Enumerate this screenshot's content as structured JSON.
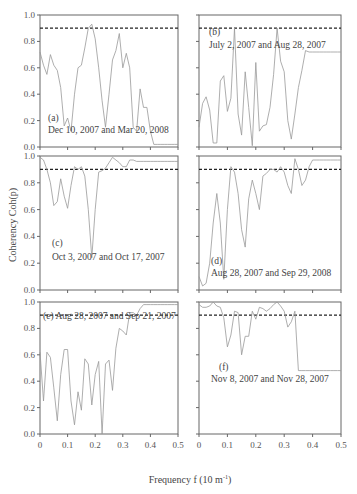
{
  "chart_data": {
    "type": "line",
    "layout": "3x2 grid of panels",
    "ylabel": "Coherency  Coh(p)",
    "xlabel_main": "Frequency f (10 m",
    "xlabel_sup": "-1",
    "xlabel_end": ")",
    "xlim": [
      0,
      0.5
    ],
    "ylim": [
      0,
      1.0
    ],
    "xticks": [
      "0",
      "0.1",
      "0.2",
      "0.3",
      "0.4",
      "0.5"
    ],
    "yticks": [
      "0.0",
      "0.2",
      "0.4",
      "0.6",
      "0.8",
      "1.0"
    ],
    "threshold": 0.9,
    "grid": false,
    "series_color": "#999999",
    "panels": [
      {
        "id": "a",
        "label": "(a)",
        "caption": "Dec 10, 2007 and Mar 20, 2008",
        "x": [
          0,
          0.0125,
          0.025,
          0.0375,
          0.05,
          0.0625,
          0.075,
          0.0875,
          0.1,
          0.1125,
          0.125,
          0.1375,
          0.15,
          0.1625,
          0.175,
          0.1875,
          0.2,
          0.2125,
          0.225,
          0.2375,
          0.25,
          0.2625,
          0.275,
          0.2875,
          0.3,
          0.3125,
          0.325,
          0.3375,
          0.35,
          0.3625,
          0.375,
          0.3875,
          0.4,
          0.4125,
          0.425,
          0.4375,
          0.45,
          0.4625,
          0.475,
          0.4875,
          0.5
        ],
        "y": [
          0.72,
          0.62,
          0.55,
          0.7,
          0.62,
          0.58,
          0.45,
          0.16,
          0.22,
          0.12,
          0.4,
          0.6,
          0.62,
          0.75,
          0.9,
          0.93,
          0.82,
          0.6,
          0.35,
          0.15,
          0.4,
          0.66,
          0.73,
          0.86,
          0.6,
          0.71,
          0.6,
          0.15,
          0.12,
          0.44,
          0.3,
          0.3,
          0.12,
          0.02,
          0.02,
          0.02,
          0.02,
          0.02,
          0.02,
          0.02,
          0.02
        ]
      },
      {
        "id": "b",
        "label": "(b)",
        "caption": "July 2, 2007 and Aug 28, 2007",
        "x": [
          0,
          0.0125,
          0.025,
          0.0375,
          0.05,
          0.0625,
          0.075,
          0.0875,
          0.1,
          0.1125,
          0.125,
          0.1375,
          0.15,
          0.1625,
          0.175,
          0.1875,
          0.2,
          0.2125,
          0.225,
          0.2375,
          0.25,
          0.2625,
          0.275,
          0.2875,
          0.3,
          0.3125,
          0.325,
          0.3375,
          0.35,
          0.3625,
          0.375,
          0.3875,
          0.4,
          0.4125,
          0.425,
          0.4375,
          0.45,
          0.4625,
          0.475,
          0.4875,
          0.5
        ],
        "y": [
          0.15,
          0.33,
          0.38,
          0.28,
          0.03,
          0.03,
          0.5,
          0.54,
          0.27,
          0.37,
          0.9,
          0.25,
          0.09,
          0.57,
          0.3,
          0.01,
          0.64,
          0.12,
          0.16,
          0.17,
          0.3,
          0.55,
          0.9,
          0.65,
          0.57,
          0.2,
          0.06,
          0.25,
          0.45,
          0.58,
          0.73,
          0.72,
          0.72,
          0.72,
          0.72,
          0.72,
          0.72,
          0.72,
          0.72,
          0.72,
          0.72
        ]
      },
      {
        "id": "c",
        "label": "(c)",
        "caption": "Oct 3, 2007 and Oct 17, 2007",
        "x": [
          0,
          0.0125,
          0.025,
          0.0375,
          0.05,
          0.0625,
          0.075,
          0.0875,
          0.1,
          0.1125,
          0.125,
          0.1375,
          0.15,
          0.1625,
          0.175,
          0.1875,
          0.2,
          0.2125,
          0.225,
          0.2375,
          0.25,
          0.2625,
          0.275,
          0.2875,
          0.3,
          0.3125,
          0.325,
          0.3375,
          0.35,
          0.3625,
          0.375,
          0.3875,
          0.4,
          0.4125,
          0.425,
          0.4375,
          0.45,
          0.4625,
          0.475,
          0.4875,
          0.5
        ],
        "y": [
          0.99,
          0.97,
          0.9,
          0.8,
          0.63,
          0.66,
          0.83,
          0.7,
          0.61,
          0.78,
          0.92,
          0.9,
          0.92,
          0.85,
          0.6,
          0.24,
          0.6,
          0.88,
          0.89,
          0.91,
          0.95,
          0.99,
          0.97,
          0.95,
          0.92,
          0.92,
          0.97,
          0.97,
          0.96,
          0.96,
          0.96,
          0.96,
          0.96,
          0.96,
          0.96,
          0.96,
          0.96,
          0.96,
          0.96,
          0.96,
          0.96
        ]
      },
      {
        "id": "d",
        "label": "(d)",
        "caption": "Aug 28, 2007 and Sep 29, 2008",
        "x": [
          0,
          0.0125,
          0.025,
          0.0375,
          0.05,
          0.0625,
          0.075,
          0.0875,
          0.1,
          0.1125,
          0.125,
          0.1375,
          0.15,
          0.1625,
          0.175,
          0.1875,
          0.2,
          0.2125,
          0.225,
          0.2375,
          0.25,
          0.2625,
          0.275,
          0.2875,
          0.3,
          0.3125,
          0.325,
          0.3375,
          0.35,
          0.3625,
          0.375,
          0.3875,
          0.4,
          0.4125,
          0.425,
          0.4375,
          0.45,
          0.4625,
          0.475,
          0.4875,
          0.5
        ],
        "y": [
          0.1,
          0.03,
          0.05,
          0.2,
          0.5,
          0.72,
          0.5,
          0.08,
          0.6,
          0.92,
          0.88,
          0.72,
          0.45,
          0.32,
          0.68,
          0.82,
          0.72,
          0.6,
          0.85,
          0.87,
          0.9,
          0.9,
          0.88,
          0.92,
          0.88,
          0.78,
          0.72,
          0.98,
          0.9,
          0.78,
          0.82,
          0.92,
          0.97,
          0.97,
          0.97,
          0.97,
          0.97,
          0.97,
          0.97,
          0.97,
          0.97
        ]
      },
      {
        "id": "e",
        "label": "(e)",
        "caption": "Aug 28, 2007 and Sep 21, 2007",
        "x": [
          0,
          0.0125,
          0.025,
          0.0375,
          0.05,
          0.0625,
          0.075,
          0.0875,
          0.1,
          0.1125,
          0.125,
          0.1375,
          0.15,
          0.1625,
          0.175,
          0.1875,
          0.2,
          0.2125,
          0.225,
          0.2375,
          0.25,
          0.2625,
          0.275,
          0.2875,
          0.3,
          0.3125,
          0.325,
          0.3375,
          0.35,
          0.3625,
          0.375,
          0.3875,
          0.4,
          0.4125,
          0.425,
          0.4375,
          0.45,
          0.4625,
          0.475,
          0.4875,
          0.5
        ],
        "y": [
          0.62,
          0.25,
          0.62,
          0.58,
          0.35,
          0.1,
          0.45,
          0.64,
          0.64,
          0.25,
          0.07,
          0.32,
          0.18,
          0.57,
          0.53,
          0.22,
          0.45,
          0.55,
          0.0,
          0.53,
          0.56,
          0.33,
          0.65,
          0.8,
          0.78,
          0.75,
          0.92,
          0.92,
          0.9,
          0.95,
          0.98,
          0.98,
          0.98,
          0.98,
          0.98,
          0.98,
          0.98,
          0.98,
          0.98,
          0.98,
          0.98
        ]
      },
      {
        "id": "f",
        "label": "(f)",
        "caption": "Nov 8, 2007 and Nov 28, 2007",
        "x": [
          0,
          0.0125,
          0.025,
          0.0375,
          0.05,
          0.0625,
          0.075,
          0.0875,
          0.1,
          0.1125,
          0.125,
          0.1375,
          0.15,
          0.1625,
          0.175,
          0.1875,
          0.2,
          0.2125,
          0.225,
          0.2375,
          0.25,
          0.2625,
          0.275,
          0.2875,
          0.3,
          0.3125,
          0.325,
          0.3375,
          0.35,
          0.3625,
          0.375,
          0.3875,
          0.4,
          0.4125,
          0.425,
          0.4375,
          0.45,
          0.4625,
          0.475,
          0.4875,
          0.5
        ],
        "y": [
          0.98,
          0.96,
          0.96,
          0.97,
          1.0,
          0.97,
          0.96,
          0.88,
          0.66,
          0.75,
          0.93,
          0.92,
          0.6,
          0.74,
          0.74,
          0.93,
          0.87,
          0.96,
          0.95,
          0.93,
          0.95,
          0.98,
          1.0,
          0.97,
          0.93,
          0.81,
          0.85,
          0.93,
          0.48,
          0.48,
          0.48,
          0.48,
          0.48,
          0.48,
          0.48,
          0.48,
          0.48,
          0.48,
          0.48,
          0.48,
          0.48
        ]
      }
    ]
  }
}
